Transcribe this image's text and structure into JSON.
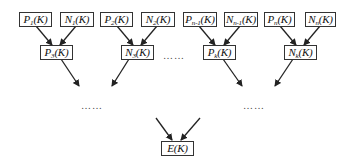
{
  "diagram": {
    "type": "binary-tree-aggregation",
    "direction": "top-to-bottom",
    "nodes": [
      {
        "id": "P1",
        "base": "P",
        "sub": "1",
        "arg": "(K)",
        "level": 0
      },
      {
        "id": "N1",
        "base": "N",
        "sub": "1",
        "arg": "(K)",
        "level": 0
      },
      {
        "id": "P2",
        "base": "P",
        "sub": "2",
        "arg": "(K)",
        "level": 0
      },
      {
        "id": "N2",
        "base": "N",
        "sub": "2",
        "arg": "(K)",
        "level": 0
      },
      {
        "id": "Pn-1",
        "base": "P",
        "sub": "n-1",
        "arg": "(K)",
        "level": 0
      },
      {
        "id": "Nn-1",
        "base": "N",
        "sub": "n-1",
        "arg": "(K)",
        "level": 0
      },
      {
        "id": "Pn",
        "base": "P",
        "sub": "n",
        "arg": "(K)",
        "level": 0
      },
      {
        "id": "Nn",
        "base": "N",
        "sub": "n",
        "arg": "(K)",
        "level": 0
      },
      {
        "id": "P3",
        "base": "P",
        "sub": "3",
        "arg": "(K)",
        "level": 1
      },
      {
        "id": "N3",
        "base": "N",
        "sub": "3",
        "arg": "(K)",
        "level": 1
      },
      {
        "id": "Pk",
        "base": "P",
        "sub": "k",
        "arg": "(K)",
        "level": 1
      },
      {
        "id": "Nk",
        "base": "N",
        "sub": "k",
        "arg": "(K)",
        "level": 1
      },
      {
        "id": "E",
        "base": "E",
        "sub": "",
        "arg": "(K)",
        "level": 3
      }
    ],
    "edges": [
      {
        "from": "P1",
        "to": "P3"
      },
      {
        "from": "N1",
        "to": "P3"
      },
      {
        "from": "P2",
        "to": "N3"
      },
      {
        "from": "N2",
        "to": "N3"
      },
      {
        "from": "Pn-1",
        "to": "Pk"
      },
      {
        "from": "Nn-1",
        "to": "Pk"
      },
      {
        "from": "Pn",
        "to": "Nk"
      },
      {
        "from": "Nn",
        "to": "Nk"
      },
      {
        "from": "P3",
        "to": "…"
      },
      {
        "from": "N3",
        "to": "…"
      },
      {
        "from": "Pk",
        "to": "…"
      },
      {
        "from": "Nk",
        "to": "…"
      },
      {
        "from": "…",
        "to": "E"
      },
      {
        "from": "…",
        "to": "E"
      }
    ],
    "ellipses": {
      "middle_level1": "……",
      "left_level2": "……",
      "right_level2": "……"
    },
    "colors": {
      "line": "#222222",
      "box_border": "#333333",
      "background": "#ffffff"
    }
  }
}
